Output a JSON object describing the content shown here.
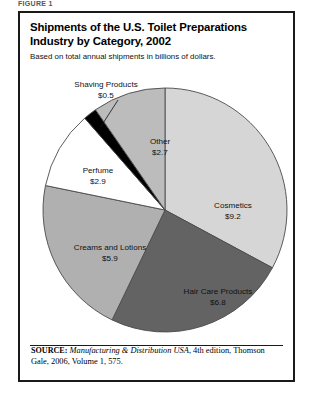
{
  "figure_label": "FIGURE 1",
  "header": {
    "title": "Shipments of the U.S. Toilet Preparations Industry by Category, 2002",
    "subtitle": "Based on total annual shipments in billions of dollars."
  },
  "source": {
    "keyword": "SOURCE:",
    "title": "Manufacturing & Distribution USA",
    "rest": ", 4th edition, Thomson Gale, 2006, Volume 1, 575."
  },
  "chart_data": {
    "type": "pie",
    "title": "Shipments of the U.S. Toilet Preparations Industry by Category, 2002",
    "subtitle": "Based on total annual shipments in billions of dollars.",
    "unit": "billions of dollars",
    "total": 28.0,
    "legend": "none",
    "grid": false,
    "start_angle_deg": 0,
    "direction": "clockwise",
    "categories": [
      "Cosmetics",
      "Hair Care Products",
      "Creams and Lotions",
      "Perfume",
      "Shaving Products",
      "Other"
    ],
    "values": [
      9.2,
      6.8,
      5.9,
      2.9,
      0.5,
      2.7
    ],
    "value_labels": [
      "$9.2",
      "$6.8",
      "$5.9",
      "$2.9",
      "$0.5",
      "$2.7"
    ],
    "colors": [
      "#d6d6d6",
      "#636363",
      "#b0b0b0",
      "#ffffff",
      "#000000",
      "#bcbcbc"
    ],
    "slices": [
      {
        "name": "Cosmetics",
        "value": 9.2,
        "value_label": "$9.2",
        "color": "#d6d6d6",
        "label_color": "#111111",
        "angle_deg": 118.3,
        "label_x": 213,
        "label_y": 195,
        "external": false
      },
      {
        "name": "Hair Care Products",
        "value": 6.8,
        "value_label": "$6.8",
        "color": "#636363",
        "label_color": "#ffffff",
        "angle_deg": 87.4,
        "label_x": 198,
        "label_y": 281,
        "external": false
      },
      {
        "name": "Creams and Lotions",
        "value": 5.9,
        "value_label": "$5.9",
        "color": "#b0b0b0",
        "label_color": "#111111",
        "angle_deg": 75.9,
        "label_x": 90,
        "label_y": 237,
        "external": false
      },
      {
        "name": "Perfume",
        "value": 2.9,
        "value_label": "$2.9",
        "color": "#ffffff",
        "label_color": "#111111",
        "angle_deg": 37.3,
        "label_x": 78,
        "label_y": 160,
        "external": false
      },
      {
        "name": "Shaving Products",
        "value": 0.5,
        "value_label": "$0.5",
        "color": "#000000",
        "label_color": "#111111",
        "angle_deg": 6.4,
        "label_x": 86,
        "label_y": 74,
        "external": true
      },
      {
        "name": "Other",
        "value": 2.7,
        "value_label": "$2.7",
        "color": "#bcbcbc",
        "label_color": "#111111",
        "angle_deg": 34.7,
        "label_x": 140,
        "label_y": 131,
        "external": false
      }
    ],
    "geometry": {
      "cx": 145,
      "cy": 197,
      "r": 122
    }
  }
}
